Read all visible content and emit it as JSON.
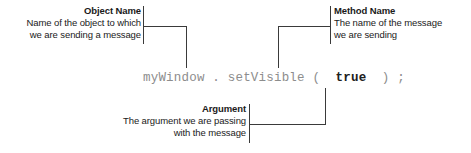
{
  "diagram": {
    "kind": "annotated-code-statement",
    "code": {
      "segments": {
        "object": "myWindow",
        "dot": ".",
        "method": "setVisible",
        "open_paren": "(",
        "argument": "true",
        "close_paren": ")",
        "semicolon": ";"
      },
      "full_text": "myWindow . setVisible (  true  ) ;",
      "pre_object": "",
      "sp1": " ",
      "sp2": " ",
      "sp3": " ",
      "sp4": "  ",
      "sp5": "  ",
      "sp6": " "
    },
    "callouts": [
      {
        "id": "object-name",
        "title": "Object Name",
        "lines": [
          "Name of the object to which",
          "we are sending a message"
        ],
        "align": "right",
        "points_to": "object"
      },
      {
        "id": "method-name",
        "title": "Method Name",
        "lines": [
          "The name of the message",
          "we are sending"
        ],
        "align": "left",
        "points_to": "method"
      },
      {
        "id": "argument",
        "title": "Argument",
        "lines": [
          "The argument we are passing",
          "with the message"
        ],
        "align": "right",
        "points_to": "argument"
      }
    ],
    "colors": {
      "text": "#1a1a1a",
      "code": "#8d8d8d",
      "code_highlight": "#202020",
      "leader_line": "#3a3a3a",
      "background": "#ffffff"
    }
  }
}
